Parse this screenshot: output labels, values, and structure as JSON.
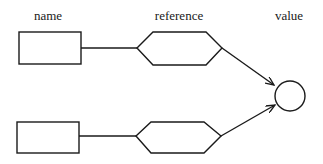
{
  "labels": {
    "name": "name",
    "reference": "reference",
    "value": "value"
  },
  "colors": {
    "stroke": "#1a1a1a",
    "background": "#ffffff"
  },
  "rows": [
    {
      "name_box": "name-box-1",
      "reference_hex": "reference-hexagon-1"
    },
    {
      "name_box": "name-box-2",
      "reference_hex": "reference-hexagon-2"
    }
  ],
  "target": "value-circle"
}
